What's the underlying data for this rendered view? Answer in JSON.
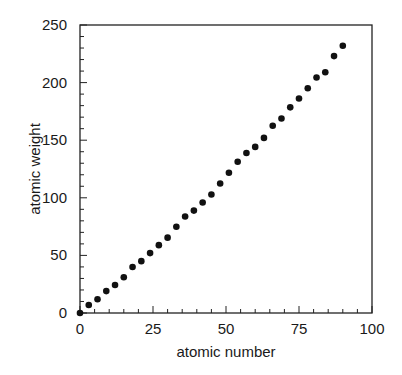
{
  "chart_data": {
    "type": "scatter",
    "title": "",
    "xlabel": "atomic number",
    "ylabel": "atomic weight",
    "xlim": [
      0,
      100
    ],
    "ylim": [
      0,
      250
    ],
    "grid": false,
    "legend": null,
    "x_ticks": [
      0,
      25,
      50,
      75,
      100
    ],
    "y_ticks": [
      0,
      50,
      100,
      150,
      200,
      250
    ],
    "x_tick_labels": [
      "0",
      "25",
      "50",
      "75",
      "100"
    ],
    "y_tick_labels": [
      "0",
      "50",
      "100",
      "150",
      "200",
      "250"
    ],
    "x_minor_step": 5,
    "y_minor_step": 10,
    "marker_color": "#111111",
    "series": [
      {
        "name": "elements",
        "x": [
          0,
          3,
          6,
          9,
          12,
          15,
          18,
          21,
          24,
          27,
          30,
          33,
          36,
          39,
          42,
          45,
          48,
          51,
          54,
          57,
          60,
          63,
          66,
          69,
          72,
          75,
          78,
          81,
          84,
          87,
          90
        ],
        "y": [
          0,
          6.9,
          12.0,
          19.0,
          24.3,
          31.0,
          39.9,
          45.0,
          52.0,
          58.9,
          65.4,
          74.9,
          83.8,
          88.9,
          95.9,
          102.9,
          112.4,
          121.8,
          131.3,
          138.9,
          144.2,
          152.0,
          162.5,
          168.9,
          178.5,
          186.2,
          195.1,
          204.4,
          209.0,
          223.0,
          232.0
        ]
      }
    ]
  }
}
